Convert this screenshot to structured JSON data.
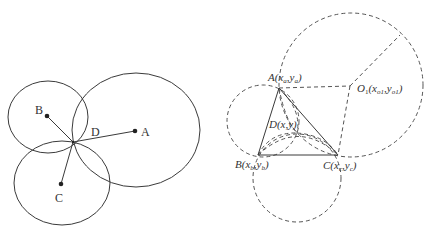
{
  "figure_left": {
    "title": "",
    "labels": {
      "A": "A",
      "B": "B",
      "C": "C",
      "D": "D"
    },
    "points": {
      "A": [
        135,
        131
      ],
      "B": [
        47,
        116
      ],
      "C": [
        61,
        184
      ],
      "D": [
        73,
        142
      ]
    },
    "circles": [
      {
        "name": "circle-A",
        "cx": 136,
        "cy": 130,
        "rx": 64,
        "ry": 57
      },
      {
        "name": "circle-B",
        "cx": 48,
        "cy": 117,
        "rx": 40,
        "ry": 36
      },
      {
        "name": "circle-C",
        "cx": 62,
        "cy": 183,
        "rx": 48,
        "ry": 42
      }
    ]
  },
  "figure_right": {
    "labels": {
      "A": "A(x",
      "A_sub": "a",
      "A_mid": ",y",
      "A_sub2": "a",
      "A_end": ")",
      "B": "B(x",
      "B_sub": "b",
      "B_mid": ",y",
      "B_sub2": "b",
      "B_end": ")",
      "C": "C(x",
      "C_sub": "c",
      "C_mid": ",y",
      "C_sub2": "c",
      "C_end": ")",
      "D": "D(x,y)",
      "O1": "O",
      "O1_sub": "1",
      "O1_paren": "(x",
      "O1_sub2": "o1",
      "O1_mid": ",y",
      "O1_sub3": "o1",
      "O1_end": ")"
    },
    "points": {
      "A": [
        279,
        88
      ],
      "B": [
        258,
        155
      ],
      "C": [
        338,
        155
      ],
      "D": [
        297,
        133
      ],
      "O1": [
        350,
        86
      ]
    },
    "dashed_circles": [
      {
        "name": "circle-O1",
        "cx": 351,
        "cy": 85,
        "r": 72
      },
      {
        "name": "circle-AB",
        "cx": 263,
        "cy": 121,
        "r": 36
      },
      {
        "name": "circle-BC",
        "cx": 297,
        "cy": 178,
        "r": 44
      }
    ]
  }
}
